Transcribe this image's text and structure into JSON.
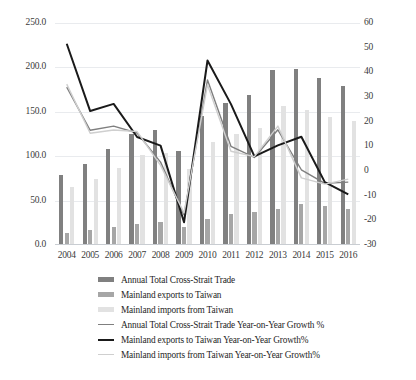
{
  "chart_data": {
    "type": "bar",
    "title": "",
    "subtitle": "",
    "xlabel": "",
    "ylabel": "",
    "categories": [
      "2004",
      "2005",
      "2006",
      "2007",
      "2008",
      "2009",
      "2010",
      "2011",
      "2012",
      "2013",
      "2014",
      "2015",
      "2016"
    ],
    "axes": {
      "left": {
        "label": "",
        "min": 0,
        "max": 250,
        "ticks": [
          "0.0",
          "50.0",
          "100.0",
          "150.0",
          "200.0",
          "250.0"
        ],
        "tick_values": [
          0,
          50,
          100,
          150,
          200,
          250
        ]
      },
      "right": {
        "label": "",
        "min": -30,
        "max": 60,
        "ticks": [
          "-30",
          "-20",
          "-10",
          "0",
          "10",
          "20",
          "30",
          "40",
          "50",
          "60"
        ],
        "tick_values": [
          -30,
          -20,
          -10,
          0,
          10,
          20,
          30,
          40,
          50,
          60
        ]
      }
    },
    "grid": true,
    "legend_position": "bottom",
    "bar_series": [
      {
        "name": "Annual Total Cross-Strait Trade",
        "axis": "left",
        "color": "#808080",
        "values": [
          78.3,
          91.2,
          107.8,
          124.5,
          129.2,
          106.2,
          145.4,
          160.0,
          168.9,
          197.3,
          198.3,
          188.2,
          179.6
        ]
      },
      {
        "name": "Mainland exports to Taiwan",
        "axis": "left",
        "color": "#a6a6a6",
        "values": [
          13.5,
          16.6,
          20.7,
          23.5,
          25.8,
          20.5,
          29.7,
          35.1,
          36.8,
          40.6,
          46.3,
          44.1,
          40.4
        ]
      },
      {
        "name": "Mainland imports from Taiwan",
        "axis": "left",
        "color": "#e2e2e2",
        "values": [
          64.8,
          74.7,
          87.1,
          101.0,
          103.3,
          85.7,
          115.7,
          124.9,
          132.2,
          156.4,
          152.0,
          144.0,
          139.2
        ]
      }
    ],
    "line_series": [
      {
        "name": "Annual Total Cross-Strait Trade Year-on-Year Growth %",
        "axis": "right",
        "color": "#7f7f7f",
        "width": 1.4,
        "values": [
          34.0,
          16.5,
          18.2,
          15.4,
          3.6,
          -17.8,
          36.9,
          10.0,
          5.5,
          16.7,
          0.5,
          -5.0,
          -4.5
        ]
      },
      {
        "name": "Mainland exports to Taiwan Year-on-Year Growth%",
        "axis": "right",
        "color": "#1a1a1a",
        "width": 2.0,
        "values": [
          51.6,
          24.3,
          27.2,
          13.8,
          10.3,
          -20.8,
          44.8,
          27.1,
          5.9,
          10.4,
          13.9,
          -4.5,
          -9.5
        ]
      },
      {
        "name": "Mainland imports from Taiwan Year-on-Year Growth%",
        "axis": "right",
        "color": "#cfcfcf",
        "width": 1.4,
        "values": [
          35.2,
          15.3,
          16.6,
          16.0,
          2.3,
          -17.0,
          35.0,
          8.0,
          5.8,
          18.2,
          -2.8,
          -5.3,
          -3.3
        ]
      }
    ],
    "legend": [
      {
        "label": "Annual Total Cross-Strait Trade",
        "marker": "bar",
        "color": "#808080"
      },
      {
        "label": "Mainland exports to Taiwan",
        "marker": "bar",
        "color": "#a6a6a6"
      },
      {
        "label": "Mainland imports from Taiwan",
        "marker": "bar",
        "color": "#e2e2e2"
      },
      {
        "label": "Annual Total Cross-Strait Trade Year-on-Year Growth %",
        "marker": "line",
        "color": "#7f7f7f"
      },
      {
        "label": "Mainland exports to Taiwan Year-on-Year Growth%",
        "marker": "line-bold",
        "color": "#1a1a1a"
      },
      {
        "label": "Mainland imports from Taiwan Year-on-Year Growth%",
        "marker": "line-light",
        "color": "#cfcfcf"
      }
    ]
  }
}
